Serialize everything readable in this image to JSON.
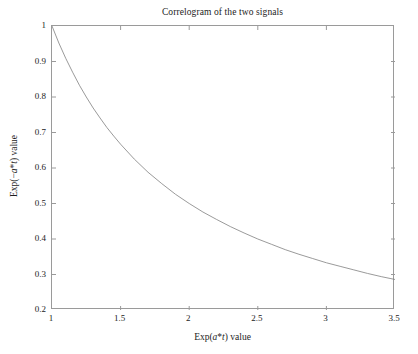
{
  "chart_data": {
    "type": "line",
    "title": "Correlogram of the two signals",
    "xlabel": "Exp(a*t) value",
    "ylabel": "Exp(-a*t) value",
    "xlim": [
      1,
      3.5
    ],
    "ylim": [
      0.2,
      1
    ],
    "grid": false,
    "legend": null,
    "xticks": [
      1,
      1.5,
      2,
      2.5,
      3,
      3.5
    ],
    "xticklabels": [
      "1",
      "1.5",
      "2",
      "2.5",
      "3",
      "3.5"
    ],
    "yticks": [
      0.2,
      0.3,
      0.4,
      0.5,
      0.6,
      0.7,
      0.8,
      0.9,
      1
    ],
    "yticklabels": [
      "0.2",
      "0.3",
      "0.4",
      "0.5",
      "0.6",
      "0.7",
      "0.8",
      "0.9",
      "1"
    ],
    "series": [
      {
        "name": "correlogram",
        "color": "#808080",
        "linewidth": 0.8,
        "relation": "y = 1/x",
        "x": [
          1.0,
          1.05,
          1.1,
          1.15,
          1.2,
          1.25,
          1.3,
          1.35,
          1.4,
          1.45,
          1.5,
          1.6,
          1.7,
          1.8,
          1.9,
          2.0,
          2.1,
          2.2,
          2.3,
          2.4,
          2.5,
          2.6,
          2.7,
          2.8,
          2.9,
          3.0,
          3.1,
          3.2,
          3.3,
          3.4,
          3.5
        ],
        "y": [
          1.0,
          0.952,
          0.909,
          0.87,
          0.833,
          0.8,
          0.769,
          0.741,
          0.714,
          0.69,
          0.667,
          0.625,
          0.588,
          0.556,
          0.526,
          0.5,
          0.476,
          0.455,
          0.435,
          0.417,
          0.4,
          0.385,
          0.37,
          0.357,
          0.345,
          0.333,
          0.323,
          0.313,
          0.303,
          0.294,
          0.286
        ]
      }
    ]
  },
  "chart_text": {
    "title": "Correlogram of the two signals",
    "xlabel_prefix": "Exp(",
    "xlabel_a": "a",
    "xlabel_star": "*",
    "xlabel_t": "t",
    "xlabel_suffix": ") value",
    "ylabel_prefix": "Exp(−",
    "ylabel_a": "a",
    "ylabel_star": "*",
    "ylabel_t": "t",
    "ylabel_suffix": ") value"
  },
  "colors": {
    "axis": "#9a9a9a",
    "line": "#808080",
    "text": "#1c1c1c",
    "background": "#ffffff"
  }
}
